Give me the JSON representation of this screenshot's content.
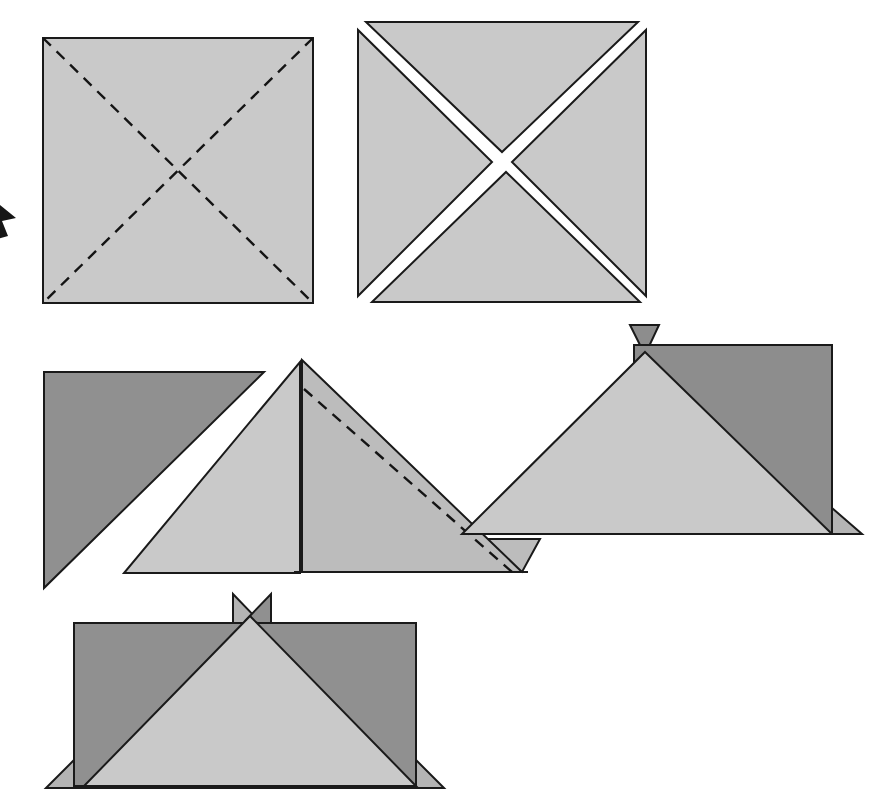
{
  "document": {
    "kind": "paper-folding-instruction-diagram",
    "title": "Paper Folding Steps",
    "background_color": "#ffffff",
    "canvas": {
      "width": 886,
      "height": 812
    }
  },
  "palette": {
    "paper_light": "#c9c9c9",
    "paper_medium": "#bcbcbc",
    "paper_dark": "#909090",
    "paper_dark_alt": "#8d8d8d",
    "paper_flap_light": "#b4b4b4",
    "outline": "#1a1a1a",
    "fold_dash": "#141414",
    "arrow_fill": "#161616",
    "background": "#ffffff"
  },
  "steps": [
    {
      "id": "step-1",
      "name": "square-with-diagonal-creases",
      "label": "Step 1",
      "description": "Flat square sheet with both diagonals marked as dashed fold creases",
      "square": {
        "x": 43,
        "y": 38,
        "width": 270,
        "height": 265
      },
      "fill": "#c9c9c9",
      "creases": [
        {
          "name": "diagonal-crease-tl-br",
          "x1": 43,
          "y1": 38,
          "x2": 313,
          "y2": 303
        },
        {
          "name": "diagonal-crease-tr-bl",
          "x1": 313,
          "y1": 38,
          "x2": 43,
          "y2": 303
        }
      ]
    },
    {
      "id": "step-2",
      "name": "square-split-into-four-triangles",
      "label": "Step 2",
      "description": "Same square separated along both diagonals into four triangular quarters",
      "center": {
        "x": 502,
        "y": 162
      },
      "fill": "#c9c9c9",
      "triangles": [
        {
          "name": "triangle-top",
          "points": "366,22 638,22 502,152"
        },
        {
          "name": "triangle-right",
          "points": "646,30 646,296 512,162"
        },
        {
          "name": "triangle-bottom",
          "points": "372,302 640,302 506,172"
        },
        {
          "name": "triangle-left",
          "points": "358,30 358,296 492,162"
        }
      ]
    },
    {
      "id": "step-3a",
      "name": "two-loose-triangles",
      "label": "Step 3a",
      "description": "Two separated triangles, a dark one on top-left and a light one beneath it",
      "shapes": [
        {
          "name": "dark-triangle-upper-left",
          "points": "44,372 264,372 44,588",
          "fill": "#909090"
        },
        {
          "name": "light-triangle-lower-right",
          "points": "300,362 300,573 124,573",
          "fill": "#c9c9c9"
        }
      ]
    },
    {
      "id": "step-3b",
      "name": "folded-triangle-with-crease",
      "label": "Step 3b",
      "description": "Medium grey triangle, apex top-left, with an interior dashed fold line and a notched lower-right corner",
      "shapes": [
        {
          "name": "main-folded-triangle",
          "points": "302,360 522,572 302,572",
          "fill": "#bcbcbc"
        },
        {
          "name": "lower-right-tab",
          "points": "462,539 540,539 522,572",
          "fill": "#bcbcbc"
        }
      ],
      "creases": [
        {
          "name": "interior-fold-crease",
          "x1": 304,
          "y1": 389,
          "x2": 512,
          "y2": 572
        }
      ],
      "edges": [
        {
          "name": "vertical-left-edge",
          "x1": 302,
          "y1": 360,
          "x2": 302,
          "y2": 572
        },
        {
          "name": "bottom-edge",
          "x1": 294,
          "y1": 572,
          "x2": 528,
          "y2": 572
        }
      ]
    },
    {
      "id": "step-3c",
      "name": "opened-fold-with-flaps",
      "label": "Step 3c",
      "description": "Dark panel with a large light triangle folded over it, a small dark flap at the top and a light flap at the lower right",
      "shapes": [
        {
          "name": "top-corner-flap",
          "points": "630,325 659,325 645,355",
          "fill": "#8d8d8d"
        },
        {
          "name": "dark-back-panel",
          "points": "634,345 832,345 832,534 634,534",
          "fill": "#8d8d8d"
        },
        {
          "name": "light-front-triangle",
          "points": "645,352 832,534 462,534",
          "fill": "#c9c9c9"
        },
        {
          "name": "right-bottom-flap",
          "points": "832,508 862,534 832,534",
          "fill": "#b4b4b4"
        }
      ],
      "edges": [
        {
          "name": "panel-right-edge",
          "x1": 832,
          "y1": 345,
          "x2": 832,
          "y2": 534
        },
        {
          "name": "panel-bottom-edge",
          "x1": 462,
          "y1": 534,
          "x2": 858,
          "y2": 534
        }
      ]
    },
    {
      "id": "step-4",
      "name": "finished-form-with-crown-flaps",
      "label": "Step 4",
      "description": "Completed shape: dark rectangle with a light triangle rising to a point at the top centre, two small pointed flaps above it and small flaps at the bottom corners",
      "shapes": [
        {
          "name": "crown-flap-left",
          "points": "233,594 233,626 258,620",
          "fill": "#b4b4b4"
        },
        {
          "name": "crown-flap-right",
          "points": "271,594 271,626 246,620",
          "fill": "#909090"
        },
        {
          "name": "dark-rectangle-body",
          "points": "74,623 416,623 416,786 74,786",
          "fill": "#909090"
        },
        {
          "name": "light-center-triangle",
          "points": "250,616 416,786 84,786",
          "fill": "#c9c9c9"
        },
        {
          "name": "bottom-left-flap",
          "points": "74,760 74,788 46,788",
          "fill": "#b4b4b4"
        },
        {
          "name": "bottom-right-flap",
          "points": "416,760 444,788 416,788",
          "fill": "#b4b4b4"
        }
      ],
      "edges": [
        {
          "name": "rectangle-bottom-edge",
          "x1": 46,
          "y1": 788,
          "x2": 444,
          "y2": 788
        },
        {
          "name": "rectangle-left-edge",
          "x1": 74,
          "y1": 623,
          "x2": 74,
          "y2": 788
        },
        {
          "name": "rectangle-right-edge",
          "x1": 416,
          "y1": 623,
          "x2": 416,
          "y2": 788
        }
      ]
    }
  ],
  "arrows": [
    {
      "id": "arrow-left-margin",
      "name": "fold-direction-arrow-clipped-left",
      "description": "Arrowhead clipped by the left edge of the image, pointing toward the first square",
      "points": "0,205 16,218 2,221 8,236 -6,240"
    }
  ]
}
